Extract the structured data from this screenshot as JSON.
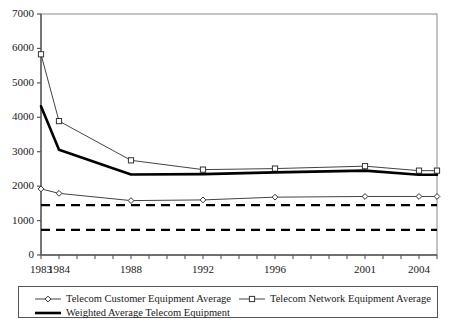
{
  "chart_data": {
    "type": "line",
    "title": "",
    "xlabel": "",
    "ylabel": "",
    "xlim": [
      1983,
      2005
    ],
    "ylim": [
      0,
      7000
    ],
    "grid": false,
    "legend_position": "bottom",
    "x": [
      1983,
      1984,
      1988,
      1992,
      1996,
      2001,
      2004,
      2005
    ],
    "xtick_labels": [
      "1983",
      "1984",
      "1988",
      "1992",
      "1996",
      "2001",
      "2004"
    ],
    "xtick_values": [
      1983,
      1984,
      1988,
      1992,
      1996,
      2001,
      2004
    ],
    "ytick_labels": [
      "0",
      "1000",
      "2000",
      "3000",
      "4000",
      "5000",
      "6000",
      "7000"
    ],
    "ytick_values": [
      0,
      1000,
      2000,
      3000,
      4000,
      5000,
      6000,
      7000
    ],
    "series": [
      {
        "name": "Telecom Customer Equipment Average",
        "marker": "diamond",
        "line_style": "solid",
        "line_width": 1,
        "color": "#444444",
        "values": [
          1920,
          1790,
          1580,
          1600,
          1680,
          1700,
          1700,
          1700
        ]
      },
      {
        "name": "Telecom Network Equipment Average",
        "marker": "square",
        "line_style": "solid",
        "line_width": 1,
        "color": "#444444",
        "values": [
          5830,
          3890,
          2750,
          2480,
          2510,
          2580,
          2450,
          2450
        ]
      },
      {
        "name": "Weighted Average Telecom Equipment",
        "marker": "none",
        "line_style": "solid",
        "line_width": 2.6,
        "color": "#000000",
        "values": [
          4320,
          3060,
          2340,
          2350,
          2400,
          2450,
          2330,
          2330
        ]
      }
    ],
    "reference_lines": [
      {
        "name": "upper-reference-line",
        "value": 1450,
        "style": "dashed",
        "color": "#000000"
      },
      {
        "name": "lower-reference-line",
        "value": 730,
        "style": "dashed",
        "color": "#000000"
      }
    ]
  },
  "legend": {
    "entries": [
      {
        "label": "Telecom Customer Equipment Average",
        "marker": "diamond"
      },
      {
        "label": "Telecom Network Equipment Average",
        "marker": "square"
      },
      {
        "label": "Weighted Average Telecom Equipment",
        "marker": "none"
      }
    ]
  }
}
